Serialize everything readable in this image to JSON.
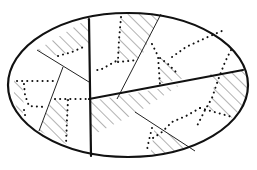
{
  "diagram": {
    "type": "partitioned-ellipse",
    "colors": {
      "line": "#111111",
      "hatch": "#555555",
      "background": "#ffffff"
    },
    "ellipse": {
      "cx": 128,
      "cy": 85,
      "rx": 120,
      "ry": 72
    },
    "thick_lines": [
      {
        "id": "vertical-divider",
        "x1": 89,
        "y1": 19,
        "x2": 91,
        "y2": 156
      },
      {
        "id": "horizontal-divider",
        "x1": 89,
        "y1": 99,
        "x2": 243,
        "y2": 70
      }
    ],
    "thin_lines": [
      {
        "id": "top-right-diagonal",
        "x1": 161,
        "y1": 14,
        "x2": 117,
        "y2": 99
      },
      {
        "id": "top-left-diagonal",
        "x1": 37,
        "y1": 50,
        "x2": 89,
        "y2": 82
      },
      {
        "id": "left-diagonal",
        "x1": 63,
        "y1": 67,
        "x2": 39,
        "y2": 131
      },
      {
        "id": "bottom-right-diagonal",
        "x1": 135,
        "y1": 112,
        "x2": 195,
        "y2": 151
      }
    ],
    "hatched_regions_count": 7,
    "dotted_paths_count": 7
  }
}
